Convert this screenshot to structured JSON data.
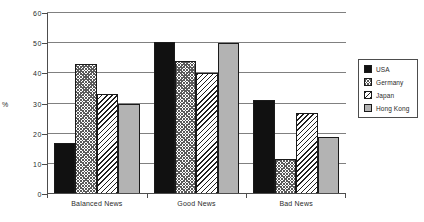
{
  "chart_data": {
    "type": "bar",
    "title": "",
    "xlabel": "",
    "ylabel": "%",
    "ylim": [
      0,
      60
    ],
    "yticks": [
      0,
      10,
      20,
      30,
      40,
      50,
      60
    ],
    "ytick_labels": [
      "0",
      "10",
      "20",
      "30",
      "40",
      "50",
      "60"
    ],
    "grid": true,
    "legend_position": "right",
    "categories": [
      "Balanced News",
      "Good News",
      "Bad News"
    ],
    "series": [
      {
        "name": "USA",
        "values": [
          17,
          50.5,
          31
        ],
        "pattern": "solid-black",
        "color": "#111111"
      },
      {
        "name": "Germany",
        "values": [
          43,
          44,
          11.5
        ],
        "pattern": "cross-hatch",
        "color": "#5a5a5a"
      },
      {
        "name": "Japan",
        "values": [
          33,
          40,
          27
        ],
        "pattern": "diagonal-hatch",
        "color": "#1f1f1f"
      },
      {
        "name": "Hong Kong",
        "values": [
          30,
          50,
          19
        ],
        "pattern": "solid-gray",
        "color": "#b3b3b3"
      }
    ]
  },
  "legend": {
    "items": [
      {
        "label": "USA"
      },
      {
        "label": "Germany"
      },
      {
        "label": "Japan"
      },
      {
        "label": "Hong Kong"
      }
    ]
  }
}
